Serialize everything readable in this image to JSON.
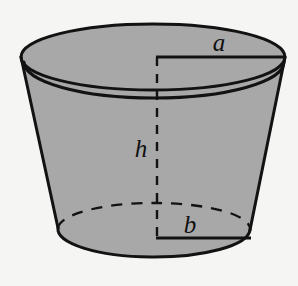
{
  "figure": {
    "name": "frustum-diagram",
    "background_color": "#f5f5f3",
    "solid_fill_color": "#a8a8a8",
    "outline_color": "#121212",
    "labels": {
      "top_radius": "a",
      "bottom_radius": "b",
      "height": "h"
    },
    "geometry": {
      "top_ellipse": {
        "cx": 153,
        "cy": 57,
        "rx": 132,
        "ry": 33
      },
      "bottom_ellipse": {
        "cx": 154,
        "cy": 232,
        "rx": 96,
        "ry": 26
      },
      "height_line": {
        "x": 157,
        "y_top": 57,
        "y_bottom": 238
      },
      "top_radius_line": {
        "y": 57,
        "x_start": 157,
        "x_end": 285
      },
      "bottom_radius_line": {
        "y": 238,
        "x_start": 157,
        "x_end": 250
      }
    },
    "label_positions": {
      "top_radius": {
        "x": 219,
        "y": 51
      },
      "bottom_radius": {
        "x": 188,
        "y": 233
      },
      "height": {
        "x": 141,
        "y": 157
      }
    }
  }
}
